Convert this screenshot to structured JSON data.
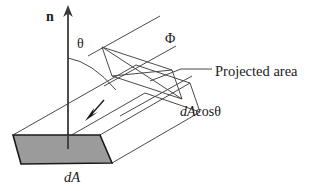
{
  "figure": {
    "title_text": "",
    "labels": {
      "normal_vector": "n",
      "angle": "θ",
      "flux": "Φ",
      "projected_area": "Projected area",
      "projected_area_value_prefix": "dA",
      "projected_area_value_cos": "cos",
      "projected_area_value_angle": "θ",
      "area_element": "dA"
    },
    "colors": {
      "stroke": "#3a3a3a",
      "dark_stroke": "#1a1a1a",
      "area_fill": "#9b9b9b",
      "background": "#ffffff",
      "text": "#1a1a1a"
    },
    "geometry": {
      "area_patch": "13,135 100,135 112,163 21,164",
      "normal_arrow": {
        "x": 68,
        "y_top": 6,
        "y_bottom": 147
      },
      "tube_direction_deg": -29,
      "flux_line_count": 3,
      "flow_arrow": {
        "from_x": 103,
        "from_y": 101,
        "to_x": 86,
        "to_y": 120
      }
    },
    "annotations": {
      "leader_from": "150,81",
      "leader_bend": "181,69",
      "leader_to": "212,69"
    }
  }
}
